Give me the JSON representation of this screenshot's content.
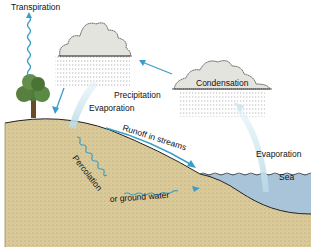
{
  "diagram": {
    "labels": {
      "transpiration": "Transpiration",
      "precipitation": "Precipitation",
      "evaporation_land": "Evaporation",
      "condensation": "Condensation",
      "evaporation_sea": "Evaporation",
      "runoff": "Runoff in streams",
      "percolation": "Percolation",
      "ground_water": "or ground water",
      "sea": "Sea"
    },
    "colors": {
      "arrow_blue": "#3a9ec8",
      "light_arrow": "#cfe8f0",
      "cloud_fill": "#e4e4df",
      "soil": "#dccb9a",
      "sea": "#a9c3d8",
      "tree_green": "#4f7a3a",
      "trunk": "#6b4a2a"
    }
  }
}
